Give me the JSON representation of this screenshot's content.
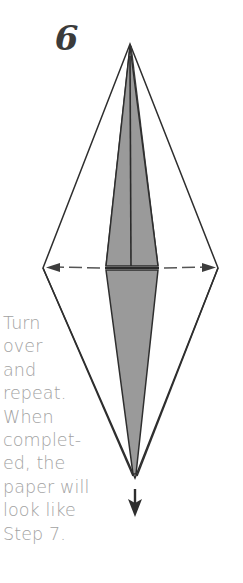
{
  "figure": {
    "step_number": "6",
    "caption_lines": [
      "Turn",
      "over",
      "and",
      "repeat.",
      "When",
      "complet-",
      "ed, the",
      "paper will",
      "look like",
      "Step 7."
    ],
    "caption_text": "Turn over and repeat. When completed, the paper will look like Step 7.",
    "colors": {
      "background": "#ffffff",
      "outline": "#2e2e2e",
      "shading": "#9a9a9a",
      "shading_dark": "#8d8d8d",
      "text": "#a2a2a2",
      "step_number": "#3b3b3b",
      "fold_line": "#555555"
    },
    "geometry": {
      "apex": [
        130,
        43
      ],
      "left_vertex": [
        43,
        268
      ],
      "right_vertex": [
        218,
        268
      ],
      "bottom_vertex": [
        135,
        478
      ],
      "shaded_half_width_at_waist": 27,
      "waist_y": 268
    },
    "annotations": {
      "fold_arrow_left": "dashed-arrow-pointing-left",
      "fold_arrow_right": "dashed-arrow-pointing-right",
      "turn_over_arrow": "arrow-pointing-down"
    }
  }
}
